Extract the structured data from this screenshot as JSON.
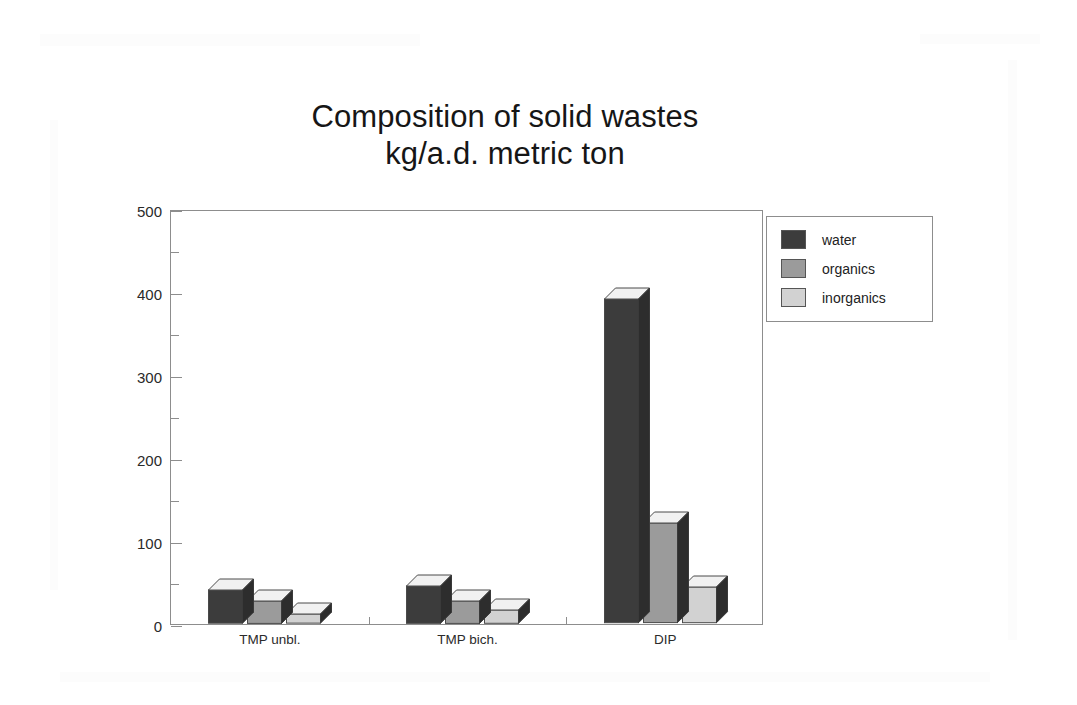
{
  "chart_data": {
    "type": "bar",
    "title": "Composition of solid wastes\nkg/a.d. metric ton",
    "title_line1": "Composition of solid wastes",
    "title_line2": "kg/a.d. metric ton",
    "xlabel": "",
    "ylabel": "",
    "ylim": [
      0,
      500
    ],
    "ytick_labels": [
      "0",
      "100",
      "200",
      "300",
      "400",
      "500"
    ],
    "ytick_values": [
      0,
      100,
      200,
      300,
      400,
      500
    ],
    "yminor_values": [
      50,
      150,
      250,
      350,
      450
    ],
    "grid": false,
    "legend_position": "outside right top",
    "categories": [
      "TMP unbl.",
      "TMP bich.",
      "DIP"
    ],
    "series": [
      {
        "name": "water",
        "values": [
          40,
          45,
          390
        ],
        "color": "#3c3c3c"
      },
      {
        "name": "organics",
        "values": [
          27,
          27,
          120
        ],
        "color": "#9b9b9b"
      },
      {
        "name": "inorganics",
        "values": [
          11,
          16,
          43
        ],
        "color": "#d2d2d2"
      }
    ]
  },
  "legend": {
    "items": [
      {
        "label": "water"
      },
      {
        "label": "organics"
      },
      {
        "label": "inorganics"
      }
    ]
  },
  "axes": {
    "y_axis_name": "value-axis",
    "x_axis_name": "category-axis"
  }
}
